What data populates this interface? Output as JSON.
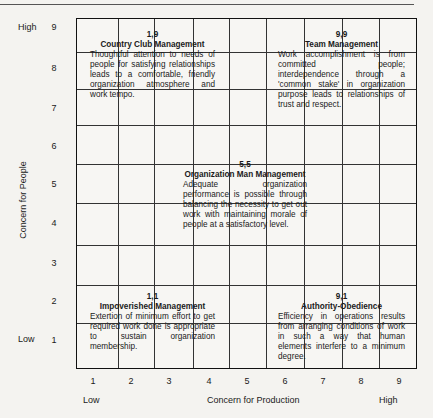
{
  "diagram": {
    "y_axis": {
      "title": "Concern for People",
      "low_label": "Low",
      "high_label": "High",
      "ticks": [
        "1",
        "2",
        "3",
        "4",
        "5",
        "6",
        "7",
        "8",
        "9"
      ]
    },
    "x_axis": {
      "title": "Concern for Production",
      "low_label": "Low",
      "high_label": "High",
      "ticks": [
        "1",
        "2",
        "3",
        "4",
        "5",
        "6",
        "7",
        "8",
        "9"
      ]
    },
    "styles": [
      {
        "coord": "1,9",
        "name": "Country Club Management",
        "description": "Thoughtful attention to needs of people for satisfying relationships leads to a comfortable, friendly organization atmosphere and work tempo."
      },
      {
        "coord": "9,9",
        "name": "Team Management",
        "description": "Work accomplishment is from committed people; interdependence through a 'common stake' in organization purpose leads to relationships of trust and respect."
      },
      {
        "coord": "5,5",
        "name": "Organization Man Management",
        "description": "Adequate organization performance is possible through balancing the necessity to get out work with maintaining morale of people at a satisfactory level."
      },
      {
        "coord": "1,1",
        "name": "Impoverished Management",
        "description": "Extertion of minimum effort to get required work done is appropriate to sustain organization membership."
      },
      {
        "coord": "9,1",
        "name": "Authority-Obedience",
        "description": "Efficiency in operations results from arranging conditions of work in such a way that human elements interfere to a minimum degree."
      }
    ]
  }
}
